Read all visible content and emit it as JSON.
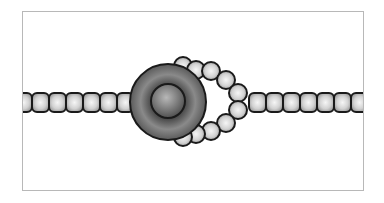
{
  "diagram": {
    "colors": {
      "frame_border": "#b8b8b8",
      "bead_outline": "#1a1a1a",
      "bead_light": "#f2f2f2",
      "bead_dark": "#9a9a9a",
      "disk_light": "#9a9a9a",
      "disk_dark": "#3e3e3e",
      "background": "#ffffff"
    },
    "left_chain": {
      "bead_count": 7,
      "shape": "rounded-square"
    },
    "right_chain": {
      "bead_count": 7,
      "shape": "rounded-square"
    },
    "loop": {
      "bead_count_top": 5,
      "bead_count_bottom": 5,
      "shape": "circle"
    },
    "central_body": {
      "shape": "torus-disk",
      "has_inner_core": true
    }
  }
}
